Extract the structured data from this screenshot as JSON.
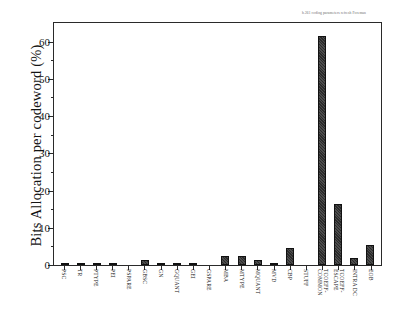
{
  "chart_data": {
    "type": "bar",
    "title": "",
    "subtitle": "",
    "xlabel": "",
    "ylabel": "Bits Allocation per codeword (%)",
    "ylim": [
      0,
      65
    ],
    "yticks": [
      0,
      10,
      20,
      30,
      40,
      50,
      60
    ],
    "ytick_labels": [
      "0",
      "10",
      "20",
      "30",
      "40",
      "50",
      "60"
    ],
    "yminor_ticks": [
      5,
      15,
      25,
      35,
      45,
      55
    ],
    "grid": false,
    "legend": null,
    "bar_color": "#2b2b2b",
    "categories": [
      "PSC",
      "TR",
      "PTYPE",
      "PEI",
      "PSPARE",
      "GBSC",
      "GN",
      "GQUANT",
      "GEI",
      "GSPARE",
      "MBA",
      "MTYPE",
      "MQUANT",
      "MVD",
      "CBP",
      "STUFF",
      "TCOEFF-\nCOMMON",
      "TCOEFF-\nESCAPE",
      "INTRA DC",
      "EOB"
    ],
    "values": [
      0.6,
      0.2,
      0.25,
      0.05,
      0.0,
      1.4,
      0.35,
      0.45,
      0.15,
      0.0,
      2.4,
      2.3,
      1.3,
      0.05,
      4.6,
      0.0,
      61.5,
      16.5,
      1.9,
      5.5
    ]
  },
  "annotations": {
    "corner_note": "h.261 coding parameters refresh Foreman"
  },
  "axes": {
    "y_axis_title": "Bits Allocation per codeword (%)"
  }
}
